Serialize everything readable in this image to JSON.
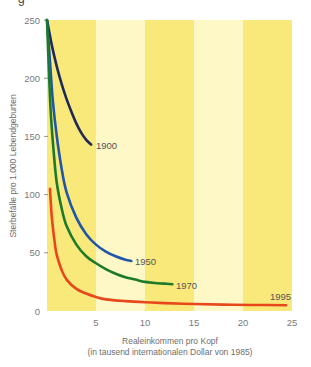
{
  "chart_data": {
    "type": "line",
    "title": "",
    "xlabel": "Realeinkommen pro Kopf",
    "xlabel_sub": "(in tausend internationalen Dollar von 1985)",
    "ylabel": "Sterbefälle pro 1.000 Lebendgeburten",
    "xlim": [
      0,
      25
    ],
    "ylim": [
      0,
      250
    ],
    "x_ticks": [
      5,
      10,
      15,
      20,
      25
    ],
    "y_ticks": [
      0,
      50,
      100,
      150,
      200,
      250
    ],
    "grid": false,
    "legend": "inline labels at curve ends",
    "background_bands": [
      {
        "from": 0,
        "to": 5,
        "color": "#f9e87a"
      },
      {
        "from": 5,
        "to": 10,
        "color": "#fdf8c6"
      },
      {
        "from": 10,
        "to": 15,
        "color": "#f9e87a"
      },
      {
        "from": 15,
        "to": 20,
        "color": "#fdf8c6"
      },
      {
        "from": 20,
        "to": 25,
        "color": "#f9e87a"
      }
    ],
    "series": [
      {
        "name": "1900",
        "color": "#1e2a5a",
        "points": [
          [
            0,
            250
          ],
          [
            0.5,
            228
          ],
          [
            1,
            210
          ],
          [
            1.5,
            195
          ],
          [
            2,
            182
          ],
          [
            2.5,
            171
          ],
          [
            3,
            161
          ],
          [
            3.5,
            153
          ],
          [
            4,
            147
          ],
          [
            4.5,
            143
          ]
        ]
      },
      {
        "name": "1950",
        "color": "#1f56a8",
        "points": [
          [
            0,
            250
          ],
          [
            0.3,
            215
          ],
          [
            0.6,
            180
          ],
          [
            1,
            150
          ],
          [
            1.5,
            122
          ],
          [
            2,
            102
          ],
          [
            3,
            80
          ],
          [
            4,
            66
          ],
          [
            5,
            57
          ],
          [
            6,
            51
          ],
          [
            7,
            47
          ],
          [
            8,
            44
          ],
          [
            8.6,
            43
          ]
        ]
      },
      {
        "name": "1970",
        "color": "#1d7a2a",
        "points": [
          [
            0,
            250
          ],
          [
            0.2,
            205
          ],
          [
            0.4,
            168
          ],
          [
            0.7,
            135
          ],
          [
            1,
            110
          ],
          [
            1.5,
            88
          ],
          [
            2,
            73
          ],
          [
            3,
            57
          ],
          [
            4,
            47
          ],
          [
            5,
            41
          ],
          [
            6,
            36
          ],
          [
            7,
            32
          ],
          [
            8,
            29
          ],
          [
            9,
            27
          ],
          [
            10,
            25
          ],
          [
            11,
            24
          ],
          [
            12,
            23.5
          ],
          [
            12.8,
            23
          ]
        ]
      },
      {
        "name": "1995",
        "color": "#e8471c",
        "points": [
          [
            0.3,
            105
          ],
          [
            0.5,
            80
          ],
          [
            0.8,
            58
          ],
          [
            1,
            48
          ],
          [
            1.5,
            35
          ],
          [
            2,
            27
          ],
          [
            3,
            19
          ],
          [
            4,
            15
          ],
          [
            5,
            12
          ],
          [
            6,
            10
          ],
          [
            8,
            8.5
          ],
          [
            10,
            7.5
          ],
          [
            12,
            6.8
          ],
          [
            15,
            6
          ],
          [
            18,
            5.5
          ],
          [
            21,
            5.2
          ],
          [
            24.4,
            5
          ]
        ]
      }
    ]
  },
  "axis": {
    "y_tick_labels": [
      "0",
      "50",
      "100",
      "150",
      "200",
      "250"
    ],
    "x_tick_labels": [
      "5",
      "10",
      "15",
      "20",
      "25"
    ],
    "x_title_line1": "Realeinkommen pro Kopf",
    "x_title_line2": "(in tausend internationalen Dollar von 1985)",
    "y_title": "Sterbefälle pro 1.000 Lebendgeburten"
  },
  "labels": {
    "s1900": "1900",
    "s1950": "1950",
    "s1970": "1970",
    "s1995": "1995"
  },
  "corner_glyph": "g"
}
